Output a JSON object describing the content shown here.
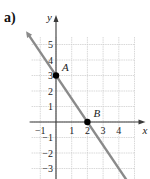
{
  "figure": {
    "part_label": "a)"
  },
  "chart_data": {
    "type": "line",
    "title": "",
    "xlabel": "x",
    "ylabel": "y",
    "xlim": [
      -2,
      5
    ],
    "ylim": [
      -4,
      6
    ],
    "grid": true,
    "x_ticks": [
      -1,
      1,
      2,
      3,
      4
    ],
    "y_ticks": [
      -3,
      -2,
      -1,
      1,
      2,
      3,
      4,
      5
    ],
    "series": [
      {
        "name": "line",
        "equation": "y = -1.5x + 3",
        "x": [
          -1.8,
          4.6
        ],
        "y": [
          5.7,
          -3.9
        ],
        "color": "#8a8a8a",
        "arrows": "both"
      }
    ],
    "points": [
      {
        "label": "A",
        "x": 0,
        "y": 3
      },
      {
        "label": "B",
        "x": 2,
        "y": 0
      }
    ],
    "colors": {
      "grid": "#c8c8c8",
      "axis": "#3a3a3a",
      "line": "#8a8a8a",
      "point": "#000000"
    }
  }
}
